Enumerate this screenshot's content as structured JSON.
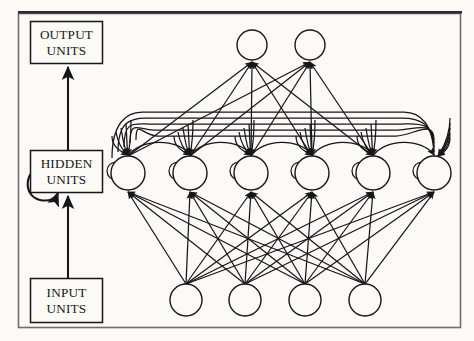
{
  "figure": {
    "background_color": "#fbfaf6",
    "ink_color": "#17161a",
    "border_color": "#55545a",
    "width": 474,
    "height": 341
  },
  "labels": {
    "output": {
      "line1": "OUTPUT",
      "line2": "UNITS"
    },
    "hidden": {
      "line1": "HIDDEN",
      "line2": "UNITS"
    },
    "input": {
      "line1": "INPUT",
      "line2": "UNITS"
    }
  },
  "legend_boxes": [
    {
      "name": "output-units-box",
      "line1": "OUTPUT",
      "line2": "UNITS",
      "x": 30,
      "y": 21,
      "w": 72,
      "h": 42
    },
    {
      "name": "hidden-units-box",
      "line1": "HIDDEN",
      "line2": "UNITS",
      "x": 30,
      "y": 150,
      "w": 72,
      "h": 42
    },
    {
      "name": "input-units-box",
      "line1": "INPUT",
      "line2": "UNITS",
      "x": 30,
      "y": 278,
      "w": 72,
      "h": 44
    }
  ],
  "legend_arrows": [
    {
      "name": "hidden-to-output-arrow",
      "x": 68,
      "y_from": 150,
      "y_to": 65
    },
    {
      "name": "input-to-hidden-arrow",
      "x": 68,
      "y_from": 278,
      "y_to": 194
    }
  ],
  "legend_self_loop": {
    "name": "hidden-self-recurrence-arrow",
    "cx": 41,
    "cy": 186,
    "r": 14
  },
  "network": {
    "output_layer": {
      "name": "output-layer",
      "count": 2,
      "radius": 15,
      "y": 45,
      "x_positions": [
        252,
        310
      ]
    },
    "hidden_layer": {
      "name": "hidden-layer",
      "count": 6,
      "radius": 17,
      "y": 173,
      "x_positions": [
        128,
        190,
        251,
        312,
        373,
        434
      ],
      "self_loop_radius": 9,
      "self_loop_offset_x": -14
    },
    "input_layer": {
      "name": "input-layer",
      "count": 4,
      "radius": 16,
      "y": 300,
      "x_positions": [
        186,
        245,
        305,
        365
      ]
    },
    "recurrent_bundle": {
      "name": "hidden-recurrent-bundle",
      "line_count": 5,
      "top_y_start": 112,
      "top_y_step": 6,
      "left_x": 112,
      "right_x": 450
    },
    "connections": {
      "input_to_hidden": "full",
      "hidden_to_output": "full",
      "hidden_to_hidden": "full-recurrent"
    }
  }
}
